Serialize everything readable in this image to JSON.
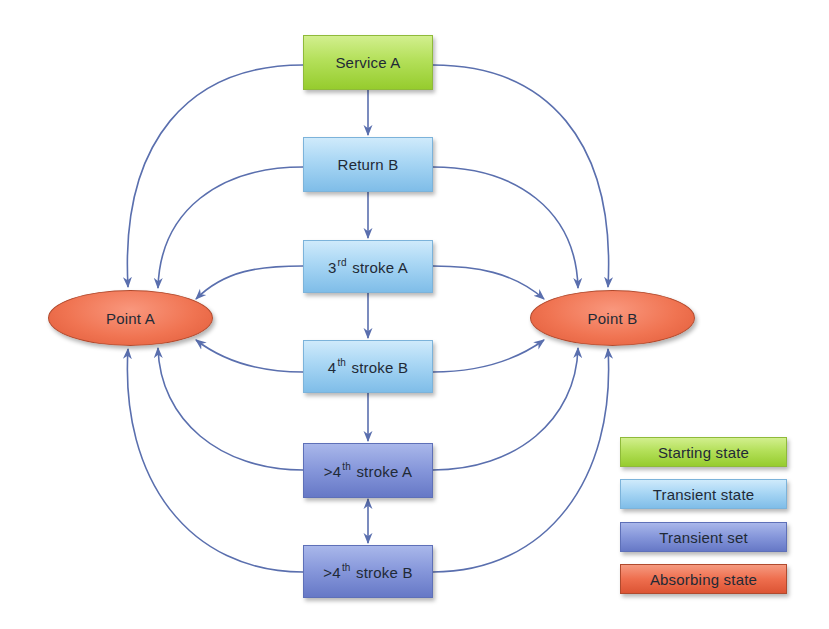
{
  "diagram": {
    "type": "markov-chain state diagram",
    "edge_color": "#5a6fae",
    "nodes": [
      {
        "id": "service_a",
        "label": "Service A",
        "kind": "starting"
      },
      {
        "id": "return_b",
        "label": "Return B",
        "kind": "transient"
      },
      {
        "id": "stroke3_a",
        "label_pre": "3",
        "label_sup": "rd",
        "label_post": " stroke A",
        "kind": "transient"
      },
      {
        "id": "stroke4_b",
        "label_pre": "4",
        "label_sup": "th",
        "label_post": " stroke B",
        "kind": "transient"
      },
      {
        "id": "gt4_a",
        "label_pre": ">4",
        "label_sup": "th",
        "label_post": " stroke A",
        "kind": "transient-set"
      },
      {
        "id": "gt4_b",
        "label_pre": ">4",
        "label_sup": "th",
        "label_post": " stroke B",
        "kind": "transient-set"
      },
      {
        "id": "point_a",
        "label": "Point A",
        "kind": "absorbing"
      },
      {
        "id": "point_b",
        "label": "Point B",
        "kind": "absorbing"
      }
    ],
    "edges": [
      {
        "from": "service_a",
        "to": "return_b"
      },
      {
        "from": "return_b",
        "to": "stroke3_a"
      },
      {
        "from": "stroke3_a",
        "to": "stroke4_b"
      },
      {
        "from": "stroke4_b",
        "to": "gt4_a"
      },
      {
        "from": "gt4_a",
        "to": "gt4_b",
        "bidirectional": true
      },
      {
        "from": "service_a",
        "to": "point_a"
      },
      {
        "from": "service_a",
        "to": "point_b"
      },
      {
        "from": "return_b",
        "to": "point_a"
      },
      {
        "from": "return_b",
        "to": "point_b"
      },
      {
        "from": "stroke3_a",
        "to": "point_a"
      },
      {
        "from": "stroke3_a",
        "to": "point_b"
      },
      {
        "from": "stroke4_b",
        "to": "point_a"
      },
      {
        "from": "stroke4_b",
        "to": "point_b"
      },
      {
        "from": "gt4_a",
        "to": "point_a"
      },
      {
        "from": "gt4_a",
        "to": "point_b"
      },
      {
        "from": "gt4_b",
        "to": "point_a"
      },
      {
        "from": "gt4_b",
        "to": "point_b"
      }
    ]
  },
  "legend": {
    "items": [
      {
        "label": "Starting state",
        "color": "#b4e05a"
      },
      {
        "label": "Transient state",
        "color": "#a8d6f4"
      },
      {
        "label": "Transient set",
        "color": "#8596da"
      },
      {
        "label": "Absorbing state",
        "color": "#f07452"
      }
    ]
  }
}
